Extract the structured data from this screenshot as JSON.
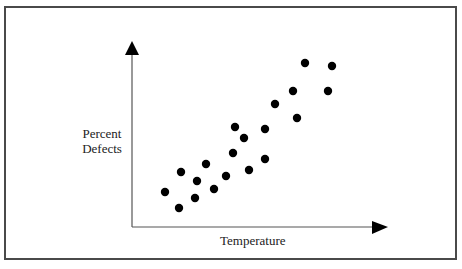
{
  "diagram": {
    "y_axis_label_line1": "Percent",
    "y_axis_label_line2": "Defects",
    "x_axis_label": "Temperature",
    "colors": {
      "frame": "#4a4a4a",
      "axis": "#555555",
      "point": "#000000",
      "background": "#ffffff"
    }
  },
  "chart_data": {
    "type": "scatter",
    "title": "",
    "xlabel": "Temperature",
    "ylabel": "Percent Defects",
    "grid": false,
    "ticks": "none",
    "note": "Coordinates are in relative units measured from the axis origin (x rightward, y upward); no numeric scale is shown.",
    "xlim": [
      0,
      255
    ],
    "ylim": [
      0,
      186
    ],
    "points": [
      {
        "x": 33,
        "y": 35
      },
      {
        "x": 47,
        "y": 19
      },
      {
        "x": 49,
        "y": 55
      },
      {
        "x": 63,
        "y": 29
      },
      {
        "x": 65,
        "y": 46
      },
      {
        "x": 74,
        "y": 63
      },
      {
        "x": 82,
        "y": 38
      },
      {
        "x": 94,
        "y": 51
      },
      {
        "x": 101,
        "y": 74
      },
      {
        "x": 103,
        "y": 100
      },
      {
        "x": 112,
        "y": 89
      },
      {
        "x": 117,
        "y": 57
      },
      {
        "x": 133,
        "y": 98
      },
      {
        "x": 133,
        "y": 68
      },
      {
        "x": 143,
        "y": 123
      },
      {
        "x": 161,
        "y": 136
      },
      {
        "x": 165,
        "y": 109
      },
      {
        "x": 173,
        "y": 164
      },
      {
        "x": 196,
        "y": 136
      },
      {
        "x": 200,
        "y": 161
      }
    ]
  }
}
